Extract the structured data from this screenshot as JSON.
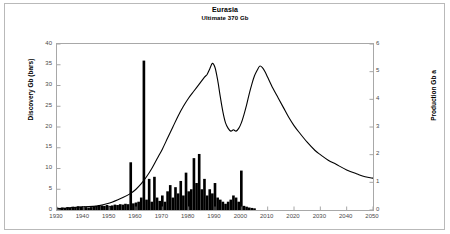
{
  "chart_data": {
    "type": "bar",
    "title": "Eurasia",
    "subtitle": "Ultimate  370 Gb",
    "xlabel": "",
    "ylabel": "Discovery Gb (bars)",
    "y2label": "Production Gb a",
    "xlim": [
      1930,
      2050
    ],
    "ylim": [
      0,
      40
    ],
    "y2lim": [
      0,
      6
    ],
    "grid": false,
    "legend": "none",
    "x_ticks": [
      1930,
      1940,
      1950,
      1960,
      1970,
      1980,
      1990,
      2000,
      2010,
      2020,
      2030,
      2040,
      2050
    ],
    "y_ticks": [
      0,
      5,
      10,
      15,
      20,
      25,
      30,
      35,
      40
    ],
    "y2_ticks": [
      0,
      1,
      2,
      3,
      4,
      5,
      6
    ],
    "series": [
      {
        "name": "Discovery Gb (bars)",
        "type": "bar",
        "axis": "left",
        "color": "#000000",
        "x": [
          1930,
          1931,
          1932,
          1933,
          1934,
          1935,
          1936,
          1937,
          1938,
          1939,
          1940,
          1941,
          1942,
          1943,
          1944,
          1945,
          1946,
          1947,
          1948,
          1949,
          1950,
          1951,
          1952,
          1953,
          1954,
          1955,
          1956,
          1957,
          1958,
          1959,
          1960,
          1961,
          1962,
          1963,
          1964,
          1965,
          1966,
          1967,
          1968,
          1969,
          1970,
          1971,
          1972,
          1973,
          1974,
          1975,
          1976,
          1977,
          1978,
          1979,
          1980,
          1981,
          1982,
          1983,
          1984,
          1985,
          1986,
          1987,
          1988,
          1989,
          1990,
          1991,
          1992,
          1993,
          1994,
          1995,
          1996,
          1997,
          1998,
          1999,
          2000,
          2001,
          2002,
          2003,
          2004,
          2005
        ],
        "values": [
          0.6,
          0.5,
          0.6,
          0.5,
          0.7,
          0.6,
          0.8,
          0.7,
          0.9,
          0.8,
          0.9,
          0.7,
          0.6,
          0.7,
          0.9,
          1.0,
          1.2,
          1.1,
          1.0,
          1.2,
          1.0,
          1.1,
          1.3,
          1.2,
          1.4,
          1.3,
          1.5,
          1.4,
          11.5,
          1.6,
          1.8,
          2.0,
          3.0,
          36.0,
          2.5,
          7.5,
          2.0,
          8.0,
          3.0,
          2.2,
          3.5,
          2.0,
          4.5,
          6.0,
          3.0,
          5.5,
          4.0,
          7.0,
          3.5,
          9.0,
          4.5,
          5.0,
          12.5,
          6.5,
          13.5,
          5.0,
          7.5,
          3.5,
          5.0,
          4.0,
          6.5,
          3.0,
          2.5,
          2.0,
          1.5,
          2.0,
          2.5,
          3.5,
          3.0,
          2.0,
          9.5,
          1.0,
          0.8,
          0.6,
          0.5,
          0.4
        ]
      },
      {
        "name": "Production Gb a",
        "type": "line",
        "axis": "right",
        "color": "#000000",
        "x": [
          1930,
          1935,
          1940,
          1945,
          1950,
          1955,
          1958,
          1960,
          1962,
          1964,
          1966,
          1968,
          1970,
          1972,
          1974,
          1976,
          1978,
          1980,
          1982,
          1984,
          1986,
          1987,
          1988,
          1989,
          1990,
          1991,
          1992,
          1993,
          1994,
          1995,
          1996,
          1997,
          1998,
          1999,
          2000,
          2001,
          2002,
          2003,
          2004,
          2005,
          2006,
          2007,
          2008,
          2009,
          2010,
          2012,
          2014,
          2016,
          2018,
          2020,
          2022,
          2025,
          2028,
          2030,
          2033,
          2036,
          2040,
          2044,
          2047,
          2050
        ],
        "values": [
          0.05,
          0.08,
          0.12,
          0.14,
          0.25,
          0.45,
          0.6,
          0.75,
          0.95,
          1.2,
          1.5,
          1.85,
          2.2,
          2.6,
          3.0,
          3.4,
          3.75,
          4.05,
          4.3,
          4.55,
          4.8,
          4.9,
          5.1,
          5.3,
          5.15,
          4.7,
          4.1,
          3.55,
          3.15,
          2.95,
          2.85,
          2.9,
          2.85,
          2.95,
          3.15,
          3.45,
          3.8,
          4.2,
          4.55,
          4.85,
          5.05,
          5.2,
          5.15,
          5.0,
          4.8,
          4.4,
          4.05,
          3.7,
          3.35,
          3.05,
          2.8,
          2.45,
          2.15,
          2.0,
          1.8,
          1.65,
          1.45,
          1.3,
          1.2,
          1.15
        ]
      }
    ]
  }
}
